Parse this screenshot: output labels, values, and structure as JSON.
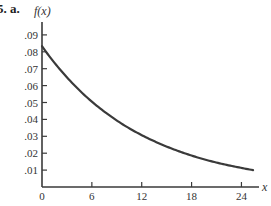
{
  "problem": {
    "label": "5. a."
  },
  "chart_data": {
    "type": "line",
    "title": "",
    "xlabel": "x",
    "ylabel": "f(x)",
    "function": "f(x) = (1/12) e^(-x/12)",
    "xlim": [
      0,
      26
    ],
    "ylim": [
      0,
      0.095
    ],
    "grid": false,
    "legend": null,
    "x_ticks": [
      0,
      6,
      12,
      18,
      24
    ],
    "x_tick_labels": [
      "0",
      "6",
      "12",
      "18",
      "24"
    ],
    "y_ticks": [
      0.01,
      0.02,
      0.03,
      0.04,
      0.05,
      0.06,
      0.07,
      0.08,
      0.09
    ],
    "y_tick_labels": [
      ".01",
      ".02",
      ".03",
      ".04",
      ".05",
      ".06",
      ".07",
      ".08",
      ".09"
    ],
    "series": [
      {
        "name": "f(x)",
        "color": "#3a3a3a",
        "x": [
          0,
          2,
          4,
          6,
          8,
          10,
          12,
          14,
          16,
          18,
          20,
          22,
          24,
          25.4
        ],
        "y": [
          0.0833,
          0.0705,
          0.0597,
          0.0505,
          0.0428,
          0.0362,
          0.0307,
          0.026,
          0.022,
          0.0186,
          0.0157,
          0.0133,
          0.0113,
          0.01
        ]
      }
    ]
  },
  "layout": {
    "origin_px": [
      42,
      187
    ],
    "x_px_per_unit": 8.31,
    "y_px_per_unit": 1690,
    "x_axis_end_px": 259,
    "y_axis_top_px": 22
  }
}
